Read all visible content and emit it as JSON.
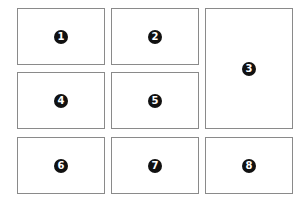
{
  "panels": [
    {
      "number": "1"
    },
    {
      "number": "2"
    },
    {
      "number": "3"
    },
    {
      "number": "4"
    },
    {
      "number": "5"
    },
    {
      "number": "6"
    },
    {
      "number": "7"
    },
    {
      "number": "8"
    }
  ],
  "colors": {
    "border": "#8a8a8a",
    "badge": "#111111",
    "background": "#ffffff"
  }
}
